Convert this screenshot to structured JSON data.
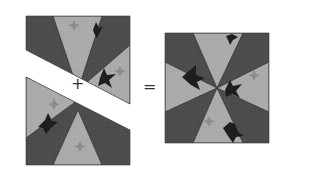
{
  "operators": {
    "plus": "+",
    "equals": "="
  },
  "colors": {
    "dark": "#4a4a4a",
    "light": "#a8a8a8",
    "star_dark": "#1e1e1e",
    "star_light": "#8c8c8c",
    "background": "#ffffff"
  },
  "pieces": [
    {
      "name": "top-half",
      "description": "Upper triangular half of block"
    },
    {
      "name": "bottom-half",
      "description": "Lower triangular half of block"
    },
    {
      "name": "finished-block",
      "description": "Completed eight-wedge pinwheel block"
    }
  ]
}
